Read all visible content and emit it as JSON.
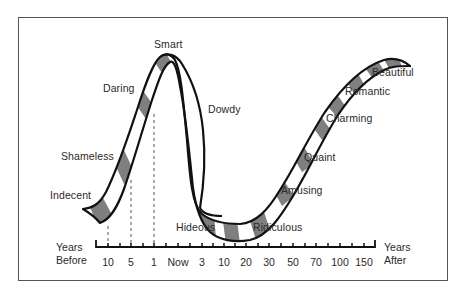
{
  "diagram": {
    "title": "",
    "stages_before": [
      {
        "label": "Indecent",
        "x": 50,
        "y": 189
      },
      {
        "label": "Shameless",
        "x": 61,
        "y": 150
      },
      {
        "label": "Daring",
        "x": 103,
        "y": 82
      },
      {
        "label": "Smart",
        "x": 154,
        "y": 38
      }
    ],
    "stages_after": [
      {
        "label": "Dowdy",
        "x": 208,
        "y": 103
      },
      {
        "label": "Hideous",
        "x": 176,
        "y": 221
      },
      {
        "label": "Ridiculous",
        "x": 253,
        "y": 221
      },
      {
        "label": "Amusing",
        "x": 281,
        "y": 184
      },
      {
        "label": "Quaint",
        "x": 304,
        "y": 151
      },
      {
        "label": "Charming",
        "x": 326,
        "y": 112
      },
      {
        "label": "Romantic",
        "x": 345,
        "y": 85
      },
      {
        "label": "Beautiful",
        "x": 372,
        "y": 66
      }
    ],
    "axis": {
      "left_label_line1": "Years",
      "left_label_line2": "Before",
      "right_label_line1": "Years",
      "right_label_line2": "After",
      "ticks": [
        {
          "label": "10",
          "x": 108
        },
        {
          "label": "5",
          "x": 131
        },
        {
          "label": "1",
          "x": 154
        },
        {
          "label": "Now",
          "x": 178
        },
        {
          "label": "3",
          "x": 202
        },
        {
          "label": "10",
          "x": 224
        },
        {
          "label": "20",
          "x": 246
        },
        {
          "label": "30",
          "x": 269
        },
        {
          "label": "50",
          "x": 293
        },
        {
          "label": "70",
          "x": 316
        },
        {
          "label": "100",
          "x": 340
        },
        {
          "label": "150",
          "x": 364
        }
      ]
    },
    "colors": {
      "ink": "#111111",
      "band_shade": "#7f7f7f",
      "frame": "#555555",
      "background": "#ffffff"
    }
  }
}
